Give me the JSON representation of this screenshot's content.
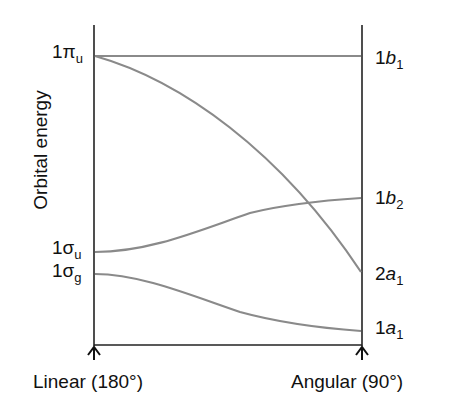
{
  "diagram": {
    "y_axis_label": "Orbital energy",
    "x_left_label": "Linear (180°)",
    "x_right_label": "Angular (90°)",
    "left_levels": [
      {
        "num": "1",
        "sym": "π",
        "sub": "u"
      },
      {
        "num": "1",
        "sym": "σ",
        "sub": "u"
      },
      {
        "num": "1",
        "sym": "σ",
        "sub": "g"
      }
    ],
    "right_levels": [
      {
        "num": "1",
        "sym": "b",
        "sub": "1"
      },
      {
        "num": "1",
        "sym": "b",
        "sub": "2"
      },
      {
        "num": "2",
        "sym": "a",
        "sub": "1"
      },
      {
        "num": "1",
        "sym": "a",
        "sub": "1"
      }
    ],
    "correlations": [
      {
        "from": "1πu",
        "to": "1b1"
      },
      {
        "from": "1πu",
        "to": "2a1"
      },
      {
        "from": "1σu",
        "to": "1b2"
      },
      {
        "from": "1σg",
        "to": "1a1"
      }
    ],
    "colors": {
      "axis": "#222222",
      "curve": "#8a8a8a"
    }
  }
}
